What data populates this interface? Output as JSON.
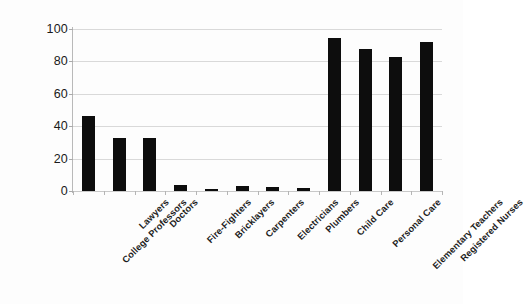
{
  "chart_data": {
    "type": "bar",
    "title": "",
    "subtitle": "",
    "xlabel": "",
    "ylabel": "",
    "categories": [
      "College Professors",
      "Lawyers",
      "Doctors",
      "Fire-Fighters",
      "Bricklayers",
      "Carpenters",
      "Electricians",
      "Plumbers",
      "Child Care",
      "Personal Care",
      "Elementary Teachers",
      "Registered Nurses"
    ],
    "values": [
      46.5,
      32.5,
      32.5,
      3.5,
      1.5,
      3,
      2.5,
      2,
      94.5,
      87.5,
      83,
      92
    ],
    "ylim": [
      0,
      100
    ],
    "yticks": [
      0,
      20,
      40,
      60,
      80,
      100
    ],
    "ytick_labels": [
      "0",
      "20",
      "40",
      "60",
      "80",
      "100"
    ],
    "grid": true,
    "grid_axis": "y",
    "legend": false,
    "legend_position": "none",
    "bar_color": "#0d0d0d",
    "grid_color": "#d9d9d9",
    "axis_color": "#b9b9b9",
    "background_color": "#fdfdfd",
    "text_color": "#1a1a1a",
    "annotations": []
  }
}
